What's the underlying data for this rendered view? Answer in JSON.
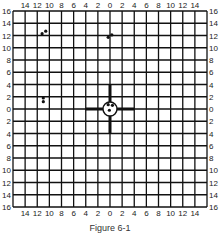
{
  "figure": {
    "caption": "Figure 6-1",
    "grid": {
      "cells": 16,
      "half_range": 16,
      "left_px": 13,
      "top_px": 11,
      "right_px": 207,
      "bottom_px": 207,
      "line_color": "#111111",
      "line_width": 1.3
    },
    "top_labels": [
      "14",
      "12",
      "10",
      "8",
      "6",
      "4",
      "2",
      "0",
      "2",
      "4",
      "6",
      "8",
      "10",
      "12",
      "14"
    ],
    "bottom_labels": [
      "14",
      "12",
      "10",
      "8",
      "6",
      "4",
      "2",
      "0",
      "2",
      "4",
      "6",
      "8",
      "10",
      "12",
      "14"
    ],
    "left_labels": [
      "16",
      "14",
      "12",
      "10",
      "8",
      "6",
      "4",
      "2",
      "0",
      "2",
      "4",
      "6",
      "8",
      "10",
      "12",
      "14",
      "16"
    ],
    "right_labels": [
      "16",
      "14",
      "12",
      "10",
      "8",
      "6",
      "4",
      "2",
      "0",
      "2",
      "4",
      "6",
      "8",
      "10",
      "12",
      "14",
      "16"
    ],
    "crosshair": {
      "arm_length_units": 4,
      "arm_width_px": 3,
      "circle_radius_px": 7,
      "color": "#111111"
    },
    "shot_groups": [
      {
        "name": "upper-left group",
        "shots": [
          [
            -11.2,
            12.3
          ],
          [
            -10.6,
            12.7
          ]
        ]
      },
      {
        "name": "upper-center group",
        "shots": [
          [
            -0.3,
            11.7
          ],
          [
            0.3,
            12.1
          ]
        ]
      },
      {
        "name": "left group",
        "shots": [
          [
            -11.0,
            1.8
          ],
          [
            -11.0,
            1.2
          ]
        ]
      },
      {
        "name": "center group",
        "shots": [
          [
            -0.3,
            0.7
          ],
          [
            0.4,
            0.6
          ],
          [
            -0.1,
            -0.2
          ]
        ]
      }
    ],
    "shot_color": "#111111",
    "shot_radius_px": 1.6
  }
}
